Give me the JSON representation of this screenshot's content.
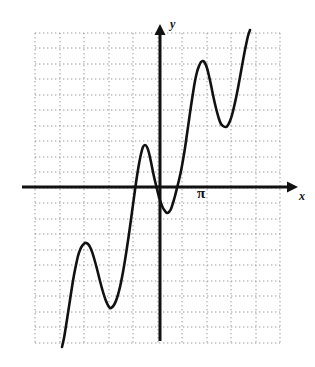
{
  "figure": {
    "type": "math-graph",
    "background_color": "#ffffff",
    "width": 315,
    "height": 367
  },
  "axes": {
    "x_axis": {
      "label": "x",
      "color": "#111111",
      "y_pixel": 187,
      "x_start": 22,
      "x_end": 298,
      "arrow": "right"
    },
    "y_axis": {
      "label": "y",
      "color": "#111111",
      "x_pixel": 160,
      "y_start": 341,
      "y_end": 24,
      "arrow": "up"
    },
    "origin": {
      "x": 160,
      "y": 187
    }
  },
  "annotations": [
    {
      "name": "pi-tick-label",
      "text": "π",
      "x": 197,
      "y": 186
    }
  ],
  "grid": {
    "color": "#9a9a9a",
    "style": "dotted",
    "vertical_lines": [
      35,
      60,
      84,
      109,
      133,
      158,
      182,
      207,
      231,
      256,
      280
    ],
    "horizontal_lines": [
      33,
      48,
      64,
      79,
      95,
      110,
      126,
      141,
      157,
      172,
      188,
      203,
      219,
      234,
      250,
      265,
      281,
      296,
      312,
      327,
      343
    ],
    "x_spacing": 24.5,
    "y_spacing": 15.5,
    "left": 35,
    "right": 280,
    "top": 33,
    "bottom": 343
  },
  "chart_data": {
    "type": "line",
    "title": "",
    "xlabel": "x",
    "ylabel": "y",
    "curve_color": "#111111",
    "curve_width": 2.6,
    "grid": true,
    "legend": false,
    "critical_points": [
      {
        "kind": "start",
        "x": 62,
        "y": 347
      },
      {
        "kind": "maximum",
        "x": 85,
        "y": 243
      },
      {
        "kind": "minimum",
        "x": 110,
        "y": 308
      },
      {
        "kind": "maximum",
        "x": 144,
        "y": 145
      },
      {
        "kind": "minimum",
        "x": 168,
        "y": 213
      },
      {
        "kind": "maximum",
        "x": 203,
        "y": 62
      },
      {
        "kind": "minimum",
        "x": 226,
        "y": 127
      },
      {
        "kind": "end",
        "x": 250,
        "y": 30
      }
    ],
    "x_intercepts_pixels": [
      135,
      157,
      180
    ],
    "points": [
      [
        62,
        347
      ],
      [
        64,
        338
      ],
      [
        66,
        326
      ],
      [
        68,
        313
      ],
      [
        70,
        300
      ],
      [
        72,
        287
      ],
      [
        74,
        275
      ],
      [
        76,
        265
      ],
      [
        78,
        256
      ],
      [
        80,
        250
      ],
      [
        82,
        246
      ],
      [
        85,
        243
      ],
      [
        88,
        244
      ],
      [
        91,
        249
      ],
      [
        94,
        258
      ],
      [
        97,
        269
      ],
      [
        100,
        281
      ],
      [
        103,
        292
      ],
      [
        106,
        301
      ],
      [
        109,
        307
      ],
      [
        111,
        308
      ],
      [
        114,
        305
      ],
      [
        117,
        298
      ],
      [
        120,
        287
      ],
      [
        123,
        272
      ],
      [
        126,
        254
      ],
      [
        129,
        234
      ],
      [
        132,
        212
      ],
      [
        135,
        190
      ],
      [
        137,
        176
      ],
      [
        139,
        164
      ],
      [
        141,
        154
      ],
      [
        143,
        147
      ],
      [
        145,
        145
      ],
      [
        147,
        147
      ],
      [
        149,
        153
      ],
      [
        151,
        162
      ],
      [
        153,
        172
      ],
      [
        155,
        181
      ],
      [
        157,
        189
      ],
      [
        159,
        197
      ],
      [
        161,
        203
      ],
      [
        163,
        208
      ],
      [
        165,
        211
      ],
      [
        167,
        213
      ],
      [
        169,
        212
      ],
      [
        171,
        209
      ],
      [
        173,
        203
      ],
      [
        175,
        196
      ],
      [
        177,
        188
      ],
      [
        179,
        180
      ],
      [
        181,
        171
      ],
      [
        183,
        160
      ],
      [
        185,
        148
      ],
      [
        187,
        134
      ],
      [
        189,
        120
      ],
      [
        191,
        106
      ],
      [
        193,
        93
      ],
      [
        195,
        81
      ],
      [
        197,
        72
      ],
      [
        199,
        66
      ],
      [
        201,
        62
      ],
      [
        203,
        61
      ],
      [
        205,
        63
      ],
      [
        207,
        68
      ],
      [
        209,
        76
      ],
      [
        211,
        85
      ],
      [
        213,
        95
      ],
      [
        215,
        104
      ],
      [
        217,
        112
      ],
      [
        219,
        119
      ],
      [
        221,
        124
      ],
      [
        223,
        126
      ],
      [
        226,
        127
      ],
      [
        228,
        125
      ],
      [
        230,
        121
      ],
      [
        232,
        115
      ],
      [
        234,
        107
      ],
      [
        236,
        98
      ],
      [
        238,
        88
      ],
      [
        240,
        77
      ],
      [
        242,
        66
      ],
      [
        244,
        55
      ],
      [
        246,
        45
      ],
      [
        248,
        36
      ],
      [
        250,
        30
      ]
    ]
  }
}
